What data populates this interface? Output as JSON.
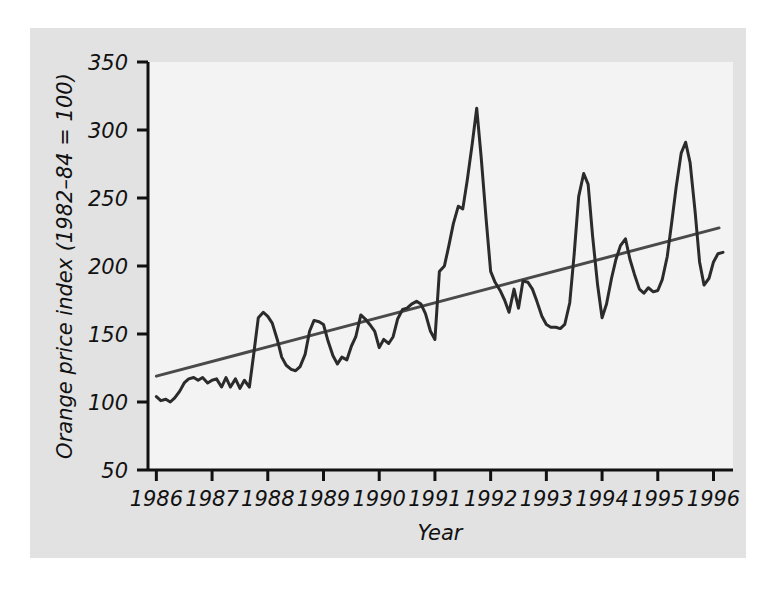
{
  "chart_data": {
    "type": "line",
    "title": "",
    "xlabel": "Year",
    "ylabel": "Orange price index (1982–84 = 100)",
    "xlim": [
      1985.85,
      1996.35
    ],
    "ylim": [
      50,
      350
    ],
    "xticks": [
      1986,
      1987,
      1988,
      1989,
      1990,
      1991,
      1992,
      1993,
      1994,
      1995,
      1996
    ],
    "xticklabels": [
      "1986",
      "1987",
      "1988",
      "1989",
      "1990",
      "1991",
      "1992",
      "1993",
      "1994",
      "1995",
      "1996"
    ],
    "yticks": [
      50,
      100,
      150,
      200,
      250,
      300,
      350
    ],
    "yticklabels": [
      "50",
      "100",
      "150",
      "200",
      "250",
      "300",
      "350"
    ],
    "grid": false,
    "legend": null,
    "series": [
      {
        "name": "Orange price index",
        "type": "line",
        "color": "#2b2b2b",
        "x": [
          1986.0,
          1986.08,
          1986.17,
          1986.25,
          1986.33,
          1986.42,
          1986.5,
          1986.58,
          1986.67,
          1986.75,
          1986.83,
          1986.92,
          1987.0,
          1987.08,
          1987.17,
          1987.25,
          1987.33,
          1987.42,
          1987.5,
          1987.58,
          1987.67,
          1987.75,
          1987.83,
          1987.92,
          1988.0,
          1988.08,
          1988.17,
          1988.25,
          1988.33,
          1988.42,
          1988.5,
          1988.58,
          1988.67,
          1988.75,
          1988.83,
          1988.92,
          1989.0,
          1989.08,
          1989.17,
          1989.25,
          1989.33,
          1989.42,
          1989.5,
          1989.58,
          1989.67,
          1989.75,
          1989.83,
          1989.92,
          1990.0,
          1990.08,
          1990.17,
          1990.25,
          1990.33,
          1990.42,
          1990.5,
          1990.58,
          1990.67,
          1990.75,
          1990.83,
          1990.92,
          1991.0,
          1991.08,
          1991.17,
          1991.25,
          1991.33,
          1991.42,
          1991.5,
          1991.58,
          1991.67,
          1991.75,
          1991.83,
          1991.92,
          1992.0,
          1992.08,
          1992.17,
          1992.25,
          1992.33,
          1992.42,
          1992.5,
          1992.58,
          1992.67,
          1992.75,
          1992.83,
          1992.92,
          1993.0,
          1993.08,
          1993.17,
          1993.25,
          1993.33,
          1993.42,
          1993.5,
          1993.58,
          1993.67,
          1993.75,
          1993.83,
          1993.92,
          1994.0,
          1994.08,
          1994.17,
          1994.25,
          1994.33,
          1994.42,
          1994.5,
          1994.58,
          1994.67,
          1994.75,
          1994.83,
          1994.92,
          1995.0,
          1995.08,
          1995.17,
          1995.25,
          1995.33,
          1995.42,
          1995.5,
          1995.58,
          1995.67,
          1995.75,
          1995.83,
          1995.92,
          1996.0,
          1996.08,
          1996.17
        ],
        "y": [
          104,
          101,
          102,
          100,
          103,
          108,
          114,
          117,
          118,
          116,
          118,
          114,
          116,
          117,
          111,
          118,
          111,
          117,
          110,
          116,
          111,
          136,
          162,
          166,
          163,
          158,
          146,
          133,
          127,
          124,
          123,
          126,
          135,
          152,
          160,
          159,
          157,
          145,
          134,
          128,
          133,
          131,
          141,
          148,
          164,
          161,
          157,
          152,
          140,
          146,
          143,
          148,
          161,
          168,
          169,
          172,
          174,
          172,
          165,
          152,
          146,
          196,
          200,
          215,
          231,
          244,
          242,
          263,
          290,
          316,
          280,
          234,
          196,
          188,
          182,
          175,
          166,
          183,
          169,
          189,
          188,
          183,
          174,
          163,
          157,
          155,
          155,
          154,
          157,
          173,
          209,
          251,
          268,
          260,
          222,
          186,
          162,
          172,
          191,
          205,
          215,
          220,
          205,
          194,
          183,
          180,
          184,
          181,
          182,
          190,
          207,
          232,
          258,
          283,
          291,
          276,
          240,
          203,
          186,
          191,
          203,
          209,
          210
        ]
      },
      {
        "name": "Linear trend",
        "type": "trendline",
        "color": "#4a4a4a",
        "x": [
          1986.0,
          1996.1
        ],
        "y": [
          119,
          228
        ]
      }
    ]
  },
  "axes": {
    "y_axis_title": "Orange price index (1982–84 = 100)",
    "x_axis_title": "Year"
  }
}
